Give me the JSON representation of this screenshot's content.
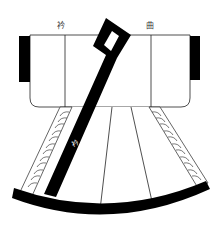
{
  "diagram": {
    "labels": {
      "top_left": "衿",
      "top_right": "曲",
      "collar_band": "衿"
    },
    "colors": {
      "ink": "#000000",
      "line": "#222222",
      "paper": "#ffffff"
    },
    "parts": [
      "left-sleeve-cuff",
      "right-sleeve-cuff",
      "upper-body",
      "collar-band",
      "collar-diamond-opening",
      "left-herringbone-trim",
      "right-herringbone-trim",
      "skirt-panels",
      "curved-hem-band"
    ]
  }
}
